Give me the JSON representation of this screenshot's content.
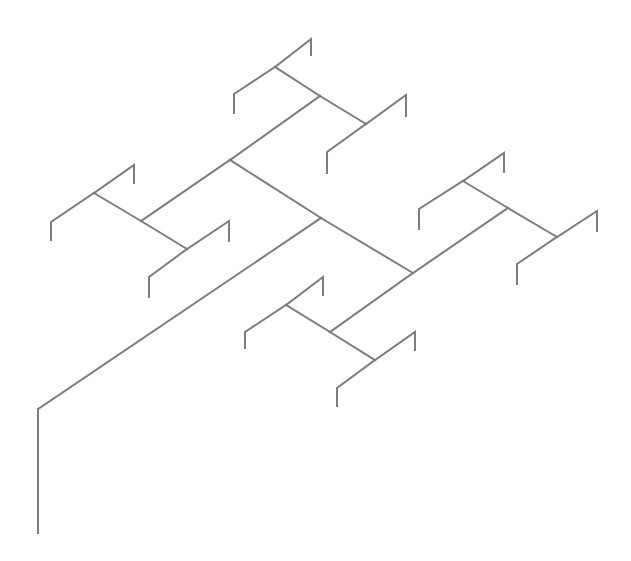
{
  "diagram": {
    "type": "fractal-tree",
    "background": "#ffffff",
    "stroke_color": "#7d7d7d",
    "stroke_width": 2,
    "width": 631,
    "height": 561,
    "segments": [
      {
        "id": "trunk-vertical",
        "points": [
          [
            38,
            533
          ],
          [
            38,
            409
          ]
        ]
      },
      {
        "id": "trunk-diagonal",
        "points": [
          [
            38,
            409
          ],
          [
            321,
            218
          ]
        ]
      },
      {
        "id": "main-upper",
        "points": [
          [
            321,
            218
          ],
          [
            230,
            160
          ]
        ]
      },
      {
        "id": "main-lower",
        "points": [
          [
            321,
            218
          ],
          [
            413,
            273
          ]
        ]
      },
      {
        "id": "upper-left-branch",
        "points": [
          [
            230,
            160
          ],
          [
            141,
            221
          ]
        ]
      },
      {
        "id": "upper-right-branch",
        "points": [
          [
            230,
            160
          ],
          [
            320,
            96
          ]
        ]
      },
      {
        "id": "ul-up",
        "points": [
          [
            141,
            221
          ],
          [
            94,
            193
          ]
        ]
      },
      {
        "id": "ul-down",
        "points": [
          [
            141,
            221
          ],
          [
            187,
            249
          ]
        ]
      },
      {
        "id": "ul-up-hook-right",
        "points": [
          [
            94,
            193
          ],
          [
            134,
            165
          ],
          [
            134,
            183
          ]
        ]
      },
      {
        "id": "ul-up-hook-left",
        "points": [
          [
            94,
            193
          ],
          [
            51,
            222
          ],
          [
            51,
            240
          ]
        ]
      },
      {
        "id": "ul-down-hook-right",
        "points": [
          [
            187,
            249
          ],
          [
            229,
            221
          ],
          [
            229,
            241
          ]
        ]
      },
      {
        "id": "ul-down-hook-left",
        "points": [
          [
            187,
            249
          ],
          [
            149,
            277
          ],
          [
            149,
            297
          ]
        ]
      },
      {
        "id": "ur-up",
        "points": [
          [
            320,
            96
          ],
          [
            275,
            67
          ]
        ]
      },
      {
        "id": "ur-down",
        "points": [
          [
            320,
            96
          ],
          [
            366,
            124
          ]
        ]
      },
      {
        "id": "ur-up-hook-right",
        "points": [
          [
            275,
            67
          ],
          [
            311,
            39
          ],
          [
            311,
            55
          ]
        ]
      },
      {
        "id": "ur-up-hook-left",
        "points": [
          [
            275,
            67
          ],
          [
            234,
            94
          ],
          [
            234,
            113
          ]
        ]
      },
      {
        "id": "ur-down-hook-right",
        "points": [
          [
            366,
            124
          ],
          [
            406,
            95
          ],
          [
            406,
            116
          ]
        ]
      },
      {
        "id": "ur-down-hook-left",
        "points": [
          [
            366,
            124
          ],
          [
            327,
            152
          ],
          [
            327,
            173
          ]
        ]
      },
      {
        "id": "lower-right-branch",
        "points": [
          [
            413,
            273
          ],
          [
            508,
            208
          ]
        ]
      },
      {
        "id": "lower-left-branch",
        "points": [
          [
            413,
            273
          ],
          [
            330,
            332
          ]
        ]
      },
      {
        "id": "lr-up",
        "points": [
          [
            508,
            208
          ],
          [
            463,
            181
          ]
        ]
      },
      {
        "id": "lr-down",
        "points": [
          [
            508,
            208
          ],
          [
            557,
            237
          ]
        ]
      },
      {
        "id": "lr-up-hook-right",
        "points": [
          [
            463,
            181
          ],
          [
            504,
            153
          ],
          [
            504,
            172
          ]
        ]
      },
      {
        "id": "lr-up-hook-left",
        "points": [
          [
            463,
            181
          ],
          [
            419,
            209
          ],
          [
            419,
            229
          ]
        ]
      },
      {
        "id": "lr-down-hook-right",
        "points": [
          [
            557,
            237
          ],
          [
            597,
            211
          ],
          [
            597,
            231
          ]
        ]
      },
      {
        "id": "lr-down-hook-left",
        "points": [
          [
            557,
            237
          ],
          [
            517,
            264
          ],
          [
            517,
            284
          ]
        ]
      },
      {
        "id": "ll-up",
        "points": [
          [
            330,
            332
          ],
          [
            286,
            305
          ]
        ]
      },
      {
        "id": "ll-down",
        "points": [
          [
            330,
            332
          ],
          [
            375,
            360
          ]
        ]
      },
      {
        "id": "ll-up-hook-right",
        "points": [
          [
            286,
            305
          ],
          [
            323,
            277
          ],
          [
            323,
            295
          ]
        ]
      },
      {
        "id": "ll-up-hook-left",
        "points": [
          [
            286,
            305
          ],
          [
            245,
            332
          ],
          [
            245,
            348
          ]
        ]
      },
      {
        "id": "ll-down-hook-right",
        "points": [
          [
            375,
            360
          ],
          [
            415,
            332
          ],
          [
            415,
            350
          ]
        ]
      },
      {
        "id": "ll-down-hook-left",
        "points": [
          [
            375,
            360
          ],
          [
            337,
            388
          ],
          [
            337,
            406
          ]
        ]
      }
    ]
  }
}
